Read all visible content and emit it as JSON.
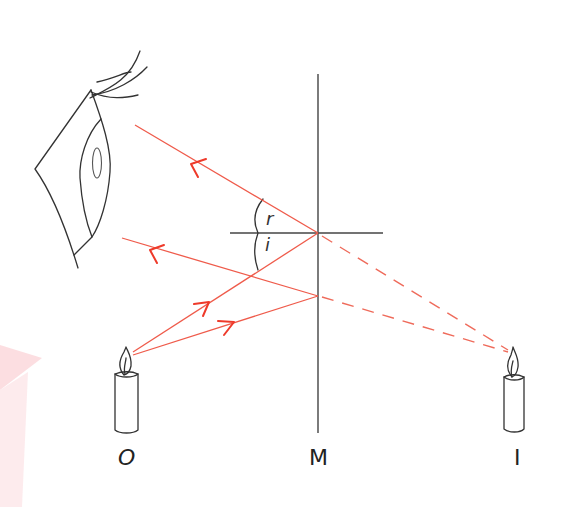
{
  "diagram": {
    "labels": {
      "object": "O",
      "mirror": "M",
      "image": "I",
      "angle_reflection": "r",
      "angle_incidence": "i"
    },
    "colors": {
      "ray": "#ef5b4b",
      "arrow": "#ee3a2a",
      "ink": "#333333",
      "watermark": "#fbd8dc"
    },
    "elements": [
      {
        "name": "eye",
        "kind": "observer"
      },
      {
        "name": "mirror",
        "kind": "plane-mirror",
        "x": 318,
        "y_top": 74,
        "y_bottom": 433
      },
      {
        "name": "normal",
        "kind": "normal-line",
        "y": 233,
        "x_from": 230,
        "x_to": 383
      },
      {
        "name": "object-candle",
        "kind": "object",
        "label": "O"
      },
      {
        "name": "image-candle",
        "kind": "virtual-image",
        "label": "I"
      }
    ],
    "rays": [
      {
        "name": "incident-ray-1",
        "from": [
          133,
          352
        ],
        "to": [
          318,
          233
        ],
        "style": "solid"
      },
      {
        "name": "reflected-ray-1",
        "from": [
          318,
          233
        ],
        "to": [
          135,
          125
        ],
        "style": "solid"
      },
      {
        "name": "incident-ray-2",
        "from": [
          133,
          352
        ],
        "to": [
          318,
          296
        ],
        "style": "solid"
      },
      {
        "name": "reflected-ray-2",
        "from": [
          318,
          296
        ],
        "to": [
          122,
          238
        ],
        "style": "solid"
      },
      {
        "name": "virtual-ray-1",
        "from": [
          318,
          233
        ],
        "to": [
          511,
          352
        ],
        "style": "dashed"
      },
      {
        "name": "virtual-ray-2",
        "from": [
          318,
          296
        ],
        "to": [
          511,
          352
        ],
        "style": "dashed"
      }
    ]
  }
}
